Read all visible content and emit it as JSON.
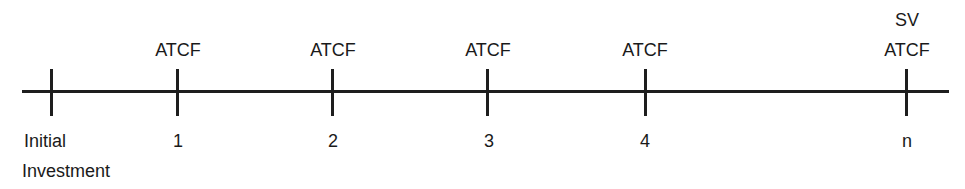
{
  "diagram": {
    "type": "cash-flow timeline",
    "periods": [
      {
        "x": 51,
        "top_labels": [],
        "bottom_labels": [
          "Initial",
          "Investment"
        ]
      },
      {
        "x": 177,
        "top_labels": [
          "ATCF"
        ],
        "bottom_labels": [
          "1"
        ]
      },
      {
        "x": 332,
        "top_labels": [
          "ATCF"
        ],
        "bottom_labels": [
          "2"
        ]
      },
      {
        "x": 487,
        "top_labels": [
          "ATCF"
        ],
        "bottom_labels": [
          "3"
        ]
      },
      {
        "x": 645,
        "top_labels": [
          "ATCF"
        ],
        "bottom_labels": [
          "4"
        ]
      },
      {
        "x": 906,
        "top_labels": [
          "SV",
          "ATCF"
        ],
        "bottom_labels": [
          "n"
        ]
      }
    ],
    "labels": {
      "p0_bottom1": "Initial",
      "p0_bottom2": "Investment",
      "p1_top": "ATCF",
      "p1_bottom": "1",
      "p2_top": "ATCF",
      "p2_bottom": "2",
      "p3_top": "ATCF",
      "p3_bottom": "3",
      "p4_top": "ATCF",
      "p4_bottom": "4",
      "pn_top1": "SV",
      "pn_top2": "ATCF",
      "pn_bottom": "n"
    },
    "line_color": "#1e1e1e",
    "text_color": "#1a1a1a"
  }
}
